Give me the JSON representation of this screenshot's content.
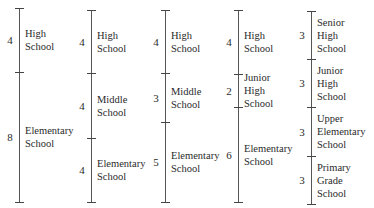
{
  "title": "",
  "columns": [
    {
      "line_x": 19,
      "top": 8,
      "bottom": 202,
      "ticks": [
        8,
        72,
        202
      ],
      "segments": [
        {
          "years": "4",
          "label": [
            "High",
            "School"
          ],
          "top": 8,
          "bottom": 72
        },
        {
          "years": "8",
          "label": [
            "Elementary",
            "School"
          ],
          "top": 72,
          "bottom": 202
        }
      ]
    },
    {
      "line_x": 91,
      "top": 10,
      "bottom": 202,
      "ticks": [
        10,
        73,
        138,
        202
      ],
      "segments": [
        {
          "years": "4",
          "label": [
            "High",
            "School"
          ],
          "top": 10,
          "bottom": 73
        },
        {
          "years": "4",
          "label": [
            "Middle",
            "School"
          ],
          "top": 73,
          "bottom": 138
        },
        {
          "years": "4",
          "label": [
            "Elementary",
            "School"
          ],
          "top": 138,
          "bottom": 202
        }
      ]
    },
    {
      "line_x": 165,
      "top": 10,
      "bottom": 202,
      "ticks": [
        10,
        73,
        122,
        202
      ],
      "segments": [
        {
          "years": "4",
          "label": [
            "High",
            "School"
          ],
          "top": 10,
          "bottom": 73
        },
        {
          "years": "3",
          "label": [
            "Middle",
            "School"
          ],
          "top": 73,
          "bottom": 122
        },
        {
          "years": "5",
          "label": [
            "Elementary",
            "School"
          ],
          "top": 122,
          "bottom": 202
        }
      ]
    },
    {
      "line_x": 238,
      "top": 10,
      "bottom": 202,
      "ticks": [
        10,
        74,
        107,
        202
      ],
      "segments": [
        {
          "years": "4",
          "label": [
            "High",
            "School"
          ],
          "top": 10,
          "bottom": 74
        },
        {
          "years": "2",
          "label": [
            "Junior",
            "High",
            "School"
          ],
          "top": 74,
          "bottom": 107
        },
        {
          "years": "6",
          "label": [
            "Elementary",
            "School"
          ],
          "top": 107,
          "bottom": 202
        }
      ]
    },
    {
      "line_x": 311,
      "top": 11,
      "bottom": 204,
      "ticks": [
        11,
        59,
        107,
        156,
        204
      ],
      "segments": [
        {
          "years": "3",
          "label": [
            "Senior",
            "High",
            "School"
          ],
          "top": 11,
          "bottom": 59
        },
        {
          "years": "3",
          "label": [
            "Junior",
            "High",
            "School"
          ],
          "top": 59,
          "bottom": 107
        },
        {
          "years": "3",
          "label": [
            "Upper",
            "Elementary",
            "School"
          ],
          "top": 107,
          "bottom": 156
        },
        {
          "years": "3",
          "label": [
            "Primary",
            "Grade",
            "School"
          ],
          "top": 156,
          "bottom": 204
        }
      ]
    }
  ]
}
